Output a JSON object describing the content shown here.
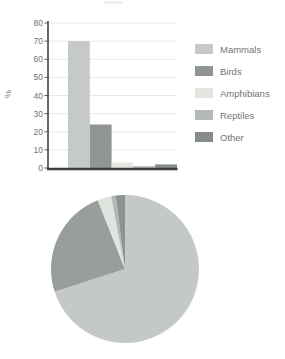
{
  "chart_data": [
    {
      "type": "bar",
      "title": "",
      "categories": [
        "Mammals",
        "Birds",
        "Amphibians",
        "Reptiles",
        "Other"
      ],
      "values": [
        70,
        24,
        3,
        1,
        2
      ],
      "xlabel": "",
      "ylabel": "%",
      "ylim": [
        0,
        80
      ],
      "yticks": [
        0,
        10,
        20,
        30,
        40,
        50,
        60,
        70,
        80
      ],
      "grid": true,
      "legend_position": "right",
      "bar_colors": [
        "#c6cac7",
        "#8f9594",
        "#e4e6e1",
        "#b3b8b5",
        "#868c8b"
      ]
    },
    {
      "type": "pie",
      "categories": [
        "Mammals",
        "Birds",
        "Amphibians",
        "Reptiles",
        "Other"
      ],
      "values": [
        70,
        24,
        3,
        1,
        2
      ],
      "colors": [
        "#c5c9c6",
        "#989e9c",
        "#e1e4de",
        "#b2b7b4",
        "#8c9291"
      ],
      "start_angle": "top",
      "direction": "clockwise"
    }
  ],
  "legend": {
    "items": [
      {
        "label": "Mammals",
        "color": "#c6cac7"
      },
      {
        "label": "Birds",
        "color": "#8f9594"
      },
      {
        "label": "Amphibians",
        "color": "#e4e6e1"
      },
      {
        "label": "Reptiles",
        "color": "#b3b8b5"
      },
      {
        "label": "Other",
        "color": "#868c8b"
      }
    ]
  },
  "styles": {
    "grid_color": "#eae8e7",
    "axis_color": "#565b5a",
    "baseline_color": "#3b403f",
    "text_color": "#6f7573",
    "background": "#ffffff"
  }
}
